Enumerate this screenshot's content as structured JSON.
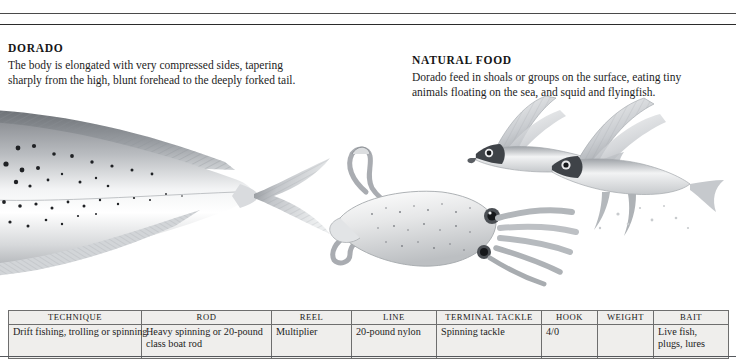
{
  "page": {
    "background": "#ffffff",
    "rule_color": "#2b2b2b"
  },
  "sections": {
    "description": {
      "heading": "DORADO",
      "lines": [
        "The body is elongated with very compressed sides, tapering",
        "sharply from the high, blunt forehead to the deeply forked tail."
      ]
    },
    "natural_food": {
      "heading": "NATURAL FOOD",
      "lines": [
        "Dorado feed in shoals or groups on the surface, eating tiny",
        "animals floating on the sea, and squid and flyingfish."
      ]
    }
  },
  "illustration": {
    "caption": "Grayscale pen-and-ink illustration of a dorado (mahi-mahi) body and tail at left, a squid in the centre, and two flyingfish at upper right",
    "subjects": [
      "dorado-fish",
      "squid",
      "flyingfish",
      "flyingfish"
    ]
  },
  "spec_table": {
    "headers": [
      "TECHNIQUE",
      "ROD",
      "REEL",
      "LINE",
      "TERMINAL TACKLE",
      "HOOK",
      "WEIGHT",
      "BAIT"
    ],
    "row": [
      {
        "lines": [
          "Drift fishing, trolling or spinning"
        ]
      },
      {
        "lines": [
          "Heavy spinning or 20-pound",
          "class boat rod"
        ]
      },
      {
        "lines": [
          "Multiplier"
        ]
      },
      {
        "lines": [
          "20-pound nylon"
        ]
      },
      {
        "lines": [
          "Spinning tackle"
        ]
      },
      {
        "lines": [
          "4/0"
        ]
      },
      {
        "lines": [
          ""
        ]
      },
      {
        "lines": [
          "Live fish,",
          "plugs, lures"
        ]
      }
    ]
  }
}
